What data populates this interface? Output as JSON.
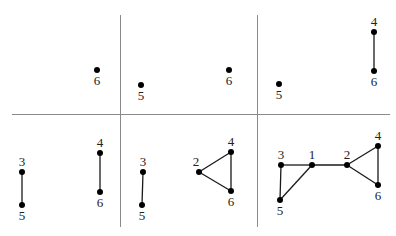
{
  "grid": {
    "color": "#8a8a8a",
    "horizontal": {
      "y": 114.5,
      "x1": 12,
      "x2": 390
    },
    "verticals": [
      {
        "x": 120.5,
        "y1": 15,
        "y2": 227
      },
      {
        "x": 257.5,
        "y1": 15,
        "y2": 227
      }
    ]
  },
  "panels": [
    {
      "id": "panel-1",
      "position": "top-left",
      "nodes": [
        {
          "id": "6",
          "label": "6",
          "x": 97,
          "y": 70,
          "label_pos": "below"
        }
      ],
      "edges": []
    },
    {
      "id": "panel-2",
      "position": "top-middle",
      "nodes": [
        {
          "id": "5",
          "label": "5",
          "x": 141,
          "y": 85,
          "label_pos": "below"
        },
        {
          "id": "6",
          "label": "6",
          "x": 229,
          "y": 70,
          "label_pos": "below"
        }
      ],
      "edges": []
    },
    {
      "id": "panel-3",
      "position": "top-right",
      "nodes": [
        {
          "id": "5",
          "label": "5",
          "x": 279,
          "y": 84,
          "label_pos": "below"
        },
        {
          "id": "4",
          "label": "4",
          "x": 374,
          "y": 32,
          "label_pos": "above"
        },
        {
          "id": "6",
          "label": "6",
          "x": 374,
          "y": 71,
          "label_pos": "below"
        }
      ],
      "edges": [
        [
          "4",
          "6"
        ]
      ]
    },
    {
      "id": "panel-4",
      "position": "bottom-left",
      "nodes": [
        {
          "id": "3",
          "label": "3",
          "x": 22,
          "y": 172,
          "label_pos": "above"
        },
        {
          "id": "5",
          "label": "5",
          "x": 22,
          "y": 205,
          "label_pos": "below"
        },
        {
          "id": "4",
          "label": "4",
          "x": 100,
          "y": 153,
          "label_pos": "above"
        },
        {
          "id": "6",
          "label": "6",
          "x": 100,
          "y": 192,
          "label_pos": "below"
        }
      ],
      "edges": [
        [
          "3",
          "5"
        ],
        [
          "4",
          "6"
        ]
      ]
    },
    {
      "id": "panel-5",
      "position": "bottom-middle",
      "nodes": [
        {
          "id": "3",
          "label": "3",
          "x": 143,
          "y": 172,
          "label_pos": "above"
        },
        {
          "id": "5",
          "label": "5",
          "x": 142,
          "y": 205,
          "label_pos": "below"
        },
        {
          "id": "2",
          "label": "2",
          "x": 199,
          "y": 172,
          "label_pos": "above-left"
        },
        {
          "id": "4",
          "label": "4",
          "x": 231,
          "y": 152,
          "label_pos": "above"
        },
        {
          "id": "6",
          "label": "6",
          "x": 231,
          "y": 191,
          "label_pos": "below"
        }
      ],
      "edges": [
        [
          "3",
          "5"
        ],
        [
          "2",
          "4"
        ],
        [
          "2",
          "6"
        ],
        [
          "4",
          "6"
        ]
      ]
    },
    {
      "id": "panel-6",
      "position": "bottom-right",
      "nodes": [
        {
          "id": "3",
          "label": "3",
          "x": 281,
          "y": 165,
          "label_pos": "above"
        },
        {
          "id": "1",
          "label": "1",
          "x": 312,
          "y": 165,
          "label_pos": "above"
        },
        {
          "id": "2",
          "label": "2",
          "x": 347,
          "y": 165,
          "label_pos": "above"
        },
        {
          "id": "4",
          "label": "4",
          "x": 378,
          "y": 146,
          "label_pos": "above"
        },
        {
          "id": "6",
          "label": "6",
          "x": 378,
          "y": 185,
          "label_pos": "below"
        },
        {
          "id": "5",
          "label": "5",
          "x": 280,
          "y": 200,
          "label_pos": "below"
        }
      ],
      "edges": [
        [
          "3",
          "1"
        ],
        [
          "3",
          "5"
        ],
        [
          "1",
          "5"
        ],
        [
          "1",
          "2"
        ],
        [
          "2",
          "4"
        ],
        [
          "2",
          "6"
        ],
        [
          "4",
          "6"
        ]
      ]
    }
  ]
}
